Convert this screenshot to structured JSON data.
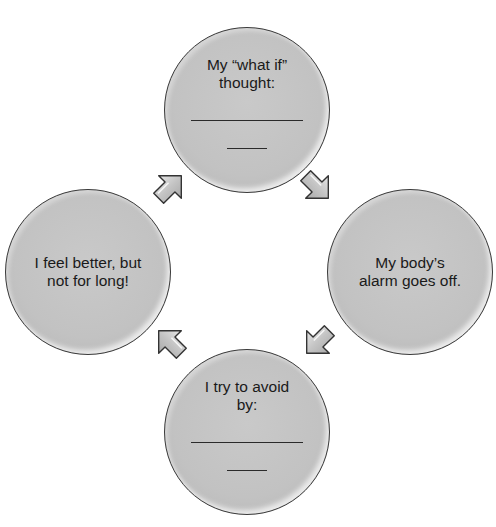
{
  "diagram": {
    "type": "cycle",
    "nodes": [
      {
        "id": "top",
        "text_lines": [
          "My “what if”",
          "thought:"
        ],
        "has_blanks": true,
        "blank_long": "",
        "blank_short": ""
      },
      {
        "id": "right",
        "text_lines": [
          "My body’s",
          "alarm goes off."
        ],
        "has_blanks": false
      },
      {
        "id": "bottom",
        "text_lines": [
          "I try to avoid",
          "by:"
        ],
        "has_blanks": true,
        "blank_long": "",
        "blank_short": ""
      },
      {
        "id": "left",
        "text_lines": [
          "I feel better, but",
          "not for long!"
        ],
        "has_blanks": false
      }
    ],
    "arrows": [
      {
        "from": "top",
        "to": "right",
        "direction": "down-right"
      },
      {
        "from": "right",
        "to": "bottom",
        "direction": "down-left"
      },
      {
        "from": "bottom",
        "to": "left",
        "direction": "up-left"
      },
      {
        "from": "left",
        "to": "top",
        "direction": "up-right"
      }
    ],
    "colors": {
      "circle_fill": "#c4c4c4",
      "circle_border": "#3a3a3a",
      "arrow_fill": "#c8c8c8",
      "background": "#ffffff"
    }
  }
}
